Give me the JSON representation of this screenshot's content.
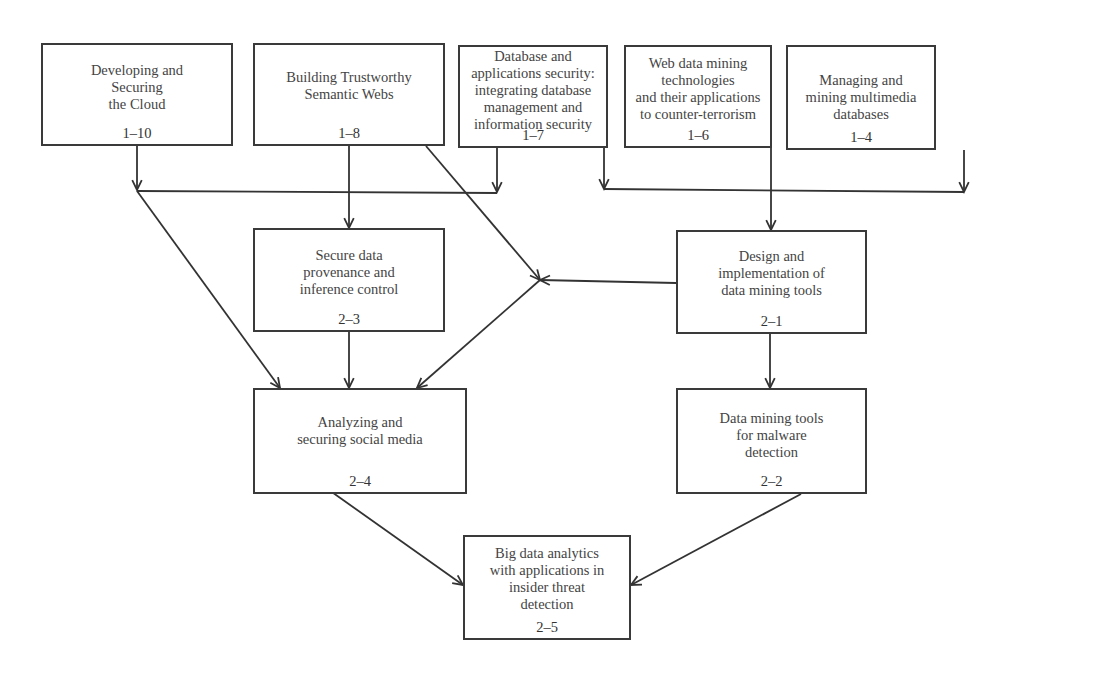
{
  "diagram": {
    "type": "dependency-flowchart",
    "nodes": [
      {
        "id": "n1-10",
        "label": "Developing and\nSecuring\nthe Cloud",
        "code": "1–10",
        "box": [
          41,
          43,
          192,
          103
        ],
        "label_top": 17
      },
      {
        "id": "n1-8",
        "label": "Building Trustworthy\nSemantic Webs",
        "code": "1–8",
        "box": [
          253,
          43,
          192,
          103
        ],
        "label_top": 24
      },
      {
        "id": "n1-7",
        "label": "Database and\napplications security:\nintegrating database\nmanagement and\ninformation security",
        "code": "1–7",
        "box": [
          458,
          45,
          150,
          103
        ],
        "label_top": 1
      },
      {
        "id": "n1-6",
        "label": "Web data mining\ntechnologies\nand their applications\nto counter-terrorism",
        "code": "1–6",
        "box": [
          624,
          45,
          148,
          103
        ],
        "label_top": 8
      },
      {
        "id": "n1-4",
        "label": "Managing and\nmining multimedia\ndatabases",
        "code": "1–4",
        "box": [
          786,
          45,
          150,
          105
        ],
        "label_top": 25
      },
      {
        "id": "n2-3",
        "label": "Secure data\nprovenance and\ninference control",
        "code": "2–3",
        "box": [
          253,
          228,
          192,
          104
        ],
        "label_top": 17
      },
      {
        "id": "n2-1",
        "label": "Design and\nimplementation of\ndata mining tools",
        "code": "2–1",
        "box": [
          676,
          230,
          191,
          104
        ],
        "label_top": 16
      },
      {
        "id": "n2-4",
        "label": "Analyzing and\nsecuring social media",
        "code": "2–4",
        "box": [
          253,
          388,
          214,
          106
        ],
        "label_top": 24
      },
      {
        "id": "n2-2",
        "label": "Data mining tools\nfor malware\ndetection",
        "code": "2–2",
        "box": [
          676,
          388,
          191,
          106
        ],
        "label_top": 20
      },
      {
        "id": "n2-5",
        "label": "Big data analytics\nwith applications in\ninsider threat\ndetection",
        "code": "2–5",
        "box": [
          463,
          535,
          168,
          105
        ],
        "label_top": 8
      }
    ],
    "edges": [
      {
        "from": "n1-10",
        "to": "junction-left",
        "points": [
          [
            137,
            146
          ],
          [
            137,
            190
          ]
        ],
        "arrow": true
      },
      {
        "from": "n1-7",
        "to": "junction-left",
        "points": [
          [
            497,
            148
          ],
          [
            497,
            192
          ]
        ],
        "arrow": true
      },
      {
        "from": "junction-left-bar",
        "to": "",
        "points": [
          [
            137,
            191
          ],
          [
            497,
            193
          ]
        ],
        "arrow": false
      },
      {
        "from": "n1-8",
        "to": "n2-3",
        "points": [
          [
            349,
            146
          ],
          [
            349,
            228
          ]
        ],
        "arrow": true
      },
      {
        "from": "junction-left",
        "to": "n2-4",
        "points": [
          [
            137,
            191
          ],
          [
            280,
            388
          ]
        ],
        "arrow": true
      },
      {
        "from": "n1-8",
        "to": "junction-mid",
        "points": [
          [
            426,
            146
          ],
          [
            540,
            280
          ]
        ],
        "arrow": true
      },
      {
        "from": "n2-1",
        "to": "junction-mid",
        "points": [
          [
            676,
            283
          ],
          [
            540,
            280
          ]
        ],
        "arrow": true
      },
      {
        "from": "junction-mid",
        "to": "n2-4",
        "points": [
          [
            540,
            280
          ],
          [
            417,
            388
          ]
        ],
        "arrow": true
      },
      {
        "from": "n2-3",
        "to": "n2-4",
        "points": [
          [
            349,
            332
          ],
          [
            349,
            388
          ]
        ],
        "arrow": true
      },
      {
        "from": "n1-7",
        "to": "junction-right",
        "points": [
          [
            604,
            148
          ],
          [
            604,
            189
          ]
        ],
        "arrow": true
      },
      {
        "from": "n1-4",
        "to": "junction-right",
        "points": [
          [
            964,
            150
          ],
          [
            964,
            192
          ]
        ],
        "arrow": true
      },
      {
        "from": "junction-right-bar",
        "to": "",
        "points": [
          [
            604,
            189
          ],
          [
            964,
            192
          ]
        ],
        "arrow": false
      },
      {
        "from": "n1-6",
        "to": "n2-1",
        "points": [
          [
            771,
            148
          ],
          [
            771,
            230
          ]
        ],
        "arrow": true
      },
      {
        "from": "n2-1",
        "to": "n2-2",
        "points": [
          [
            770,
            334
          ],
          [
            770,
            388
          ]
        ],
        "arrow": true
      },
      {
        "from": "n2-4",
        "to": "n2-5",
        "points": [
          [
            329,
            490
          ],
          [
            463,
            585
          ]
        ],
        "arrow": true
      },
      {
        "from": "n2-2",
        "to": "n2-5",
        "points": [
          [
            801,
            494
          ],
          [
            631,
            585
          ]
        ],
        "arrow": true
      }
    ]
  }
}
